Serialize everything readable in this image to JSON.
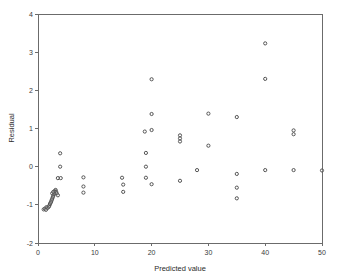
{
  "chart_data": {
    "type": "scatter",
    "title": "",
    "xlabel": "Predicted value",
    "ylabel": "Residual",
    "xlim": [
      0,
      50
    ],
    "ylim": [
      -2,
      4
    ],
    "xticks": [
      0,
      10,
      20,
      30,
      40,
      50
    ],
    "yticks": [
      -2,
      -1,
      0,
      1,
      2,
      3,
      4
    ],
    "xtick_labels": [
      "0",
      "10",
      "20",
      "30",
      "40",
      "50"
    ],
    "ytick_labels": [
      "-2",
      "-1",
      "0",
      "1",
      "2",
      "3",
      "4"
    ],
    "grid": false,
    "legend": null,
    "marker": "open-circle",
    "marker_color": "#555555",
    "marker_size": 3.2,
    "series": [
      {
        "name": "residuals",
        "points": [
          [
            1.0,
            -1.12
          ],
          [
            1.2,
            -1.1
          ],
          [
            1.4,
            -1.13
          ],
          [
            1.5,
            -1.06
          ],
          [
            1.7,
            -1.08
          ],
          [
            1.9,
            -1.05
          ],
          [
            2.0,
            -1.02
          ],
          [
            2.1,
            -0.98
          ],
          [
            2.2,
            -0.95
          ],
          [
            2.3,
            -0.92
          ],
          [
            2.4,
            -0.88
          ],
          [
            2.5,
            -0.84
          ],
          [
            2.6,
            -0.8
          ],
          [
            2.7,
            -0.76
          ],
          [
            2.8,
            -0.72
          ],
          [
            2.9,
            -0.68
          ],
          [
            3.0,
            -0.63
          ],
          [
            3.1,
            -0.61
          ],
          [
            3.2,
            -0.66
          ],
          [
            3.3,
            -0.7
          ],
          [
            3.5,
            -0.75
          ],
          [
            2.5,
            -0.7
          ],
          [
            2.7,
            -0.66
          ],
          [
            3.9,
            0.35
          ],
          [
            3.9,
            0.0
          ],
          [
            3.5,
            -0.3
          ],
          [
            4.0,
            -0.3
          ],
          [
            8.0,
            -0.28
          ],
          [
            8.0,
            -0.52
          ],
          [
            8.0,
            -0.68
          ],
          [
            14.8,
            -0.29
          ],
          [
            15.0,
            -0.47
          ],
          [
            15.0,
            -0.66
          ],
          [
            18.8,
            0.92
          ],
          [
            19.0,
            0.36
          ],
          [
            19.0,
            0.0
          ],
          [
            19.0,
            -0.29
          ],
          [
            20.0,
            2.29
          ],
          [
            20.0,
            1.38
          ],
          [
            20.0,
            0.96
          ],
          [
            20.0,
            -0.46
          ],
          [
            25.0,
            0.82
          ],
          [
            25.0,
            0.74
          ],
          [
            25.0,
            0.66
          ],
          [
            25.0,
            -0.37
          ],
          [
            28.0,
            -0.09
          ],
          [
            30.0,
            1.39
          ],
          [
            30.0,
            0.55
          ],
          [
            35.0,
            1.3
          ],
          [
            35.0,
            -0.19
          ],
          [
            35.0,
            -0.55
          ],
          [
            35.0,
            -0.83
          ],
          [
            40.0,
            3.23
          ],
          [
            40.0,
            2.3
          ],
          [
            40.0,
            -0.09
          ],
          [
            45.0,
            0.95
          ],
          [
            45.0,
            0.85
          ],
          [
            45.0,
            -0.09
          ],
          [
            50.0,
            -0.1
          ]
        ]
      }
    ]
  },
  "axes": {
    "x_title": "Predicted value",
    "y_title": "Residual"
  }
}
